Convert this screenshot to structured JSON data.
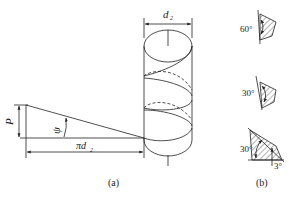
{
  "figure_a": {
    "caption": "(a)",
    "labels": {
      "pitch": "P",
      "lead_angle": "ψ",
      "circumference": "πd",
      "circumference_sub": "2",
      "diameter": "d",
      "diameter_sub": "2"
    }
  },
  "figure_b": {
    "caption": "(b)",
    "profiles": [
      {
        "angle": "60°"
      },
      {
        "angle": "30°"
      },
      {
        "angle": "30°",
        "extra_angle": "3°"
      }
    ]
  },
  "colors": {
    "stroke": "#222222",
    "background": "#ffffff"
  }
}
